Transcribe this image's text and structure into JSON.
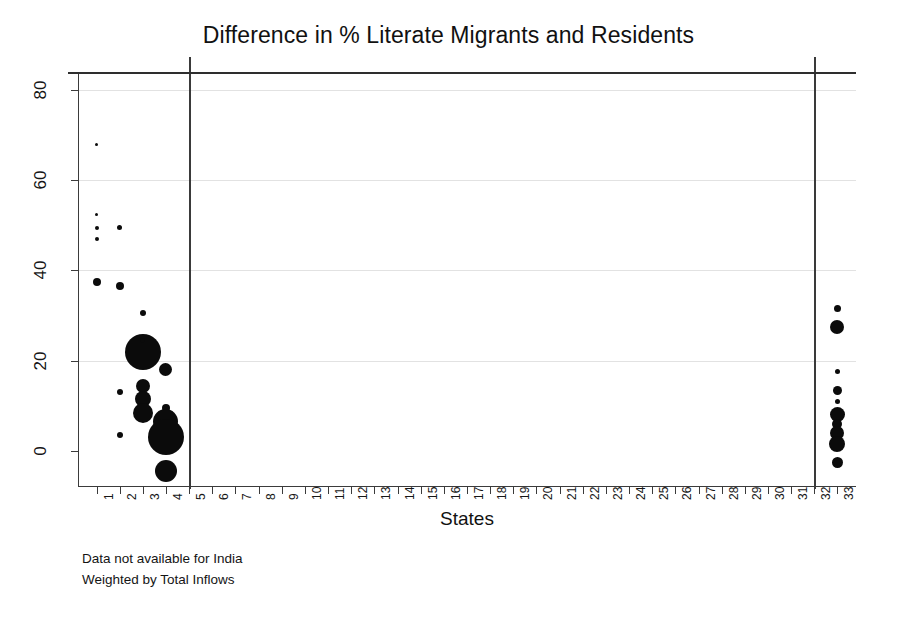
{
  "chart_data": {
    "type": "scatter",
    "title": "Difference in % Literate Migrants and Residents",
    "xlabel": "States",
    "ylabel": "",
    "xlim": [
      0.2,
      33.8
    ],
    "ylim": [
      -8,
      84
    ],
    "grid": true,
    "legend": null,
    "y_ticks": [
      0,
      20,
      40,
      60,
      80
    ],
    "x_ticks": [
      1,
      2,
      3,
      4,
      5,
      6,
      7,
      8,
      9,
      10,
      11,
      12,
      13,
      14,
      15,
      16,
      17,
      18,
      19,
      20,
      21,
      22,
      23,
      24,
      25,
      26,
      27,
      28,
      29,
      30,
      31,
      32,
      33
    ],
    "marker_color": "#0b0b0b",
    "size_encoding": "Total Inflows (bubble area)",
    "reference_lines": {
      "horizontal": [
        0
      ],
      "vertical": [
        5,
        32
      ]
    },
    "points": [
      {
        "x": 1,
        "y": 68.0,
        "size": 3
      },
      {
        "x": 1,
        "y": 52.5,
        "size": 3
      },
      {
        "x": 1,
        "y": 49.5,
        "size": 4
      },
      {
        "x": 1,
        "y": 47.0,
        "size": 4
      },
      {
        "x": 1,
        "y": 37.5,
        "size": 8
      },
      {
        "x": 2,
        "y": 49.5,
        "size": 5
      },
      {
        "x": 2,
        "y": 36.5,
        "size": 8
      },
      {
        "x": 3,
        "y": 30.5,
        "size": 6
      },
      {
        "x": 3,
        "y": 22.0,
        "size": 36
      },
      {
        "x": 3,
        "y": 24.5,
        "size": 5
      },
      {
        "x": 3,
        "y": 14.5,
        "size": 14
      },
      {
        "x": 3,
        "y": 11.5,
        "size": 16
      },
      {
        "x": 3,
        "y": 8.5,
        "size": 20
      },
      {
        "x": 2,
        "y": 13.0,
        "size": 6
      },
      {
        "x": 2,
        "y": 3.5,
        "size": 6
      },
      {
        "x": 4,
        "y": 18.0,
        "size": 13
      },
      {
        "x": 4,
        "y": 9.5,
        "size": 8
      },
      {
        "x": 4,
        "y": 6.5,
        "size": 25
      },
      {
        "x": 4,
        "y": 3.0,
        "size": 36
      },
      {
        "x": 4,
        "y": -4.5,
        "size": 22
      },
      {
        "x": 33,
        "y": 31.5,
        "size": 7
      },
      {
        "x": 33,
        "y": 27.5,
        "size": 14
      },
      {
        "x": 33,
        "y": 17.5,
        "size": 5
      },
      {
        "x": 33,
        "y": 13.5,
        "size": 9
      },
      {
        "x": 33,
        "y": 11.0,
        "size": 5
      },
      {
        "x": 33,
        "y": 8.0,
        "size": 15
      },
      {
        "x": 33,
        "y": 6.0,
        "size": 10
      },
      {
        "x": 33,
        "y": 4.0,
        "size": 14
      },
      {
        "x": 33,
        "y": 1.5,
        "size": 16
      },
      {
        "x": 33,
        "y": -2.5,
        "size": 11
      }
    ]
  },
  "footnotes": [
    "Data not available for India",
    "Weighted by Total Inflows"
  ]
}
